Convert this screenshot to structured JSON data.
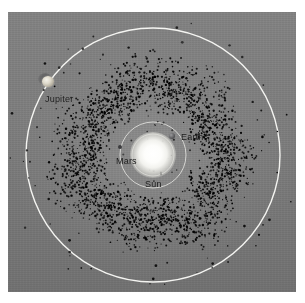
{
  "figure": {
    "background_color": "#7b7b7b",
    "panel": {
      "x": 8,
      "y": 12,
      "width": 288,
      "height": 280
    }
  },
  "chart_data": {
    "type": "scatter",
    "xlabel": "",
    "ylabel": "",
    "grid": false,
    "legend_position": "none",
    "coordinate_system": "polar (ecliptic plane, heliocentric)",
    "center_px": {
      "x": 145,
      "y": 143
    },
    "background_color": "#7b7b7b",
    "asteroid_color": "#ffffff",
    "orbit_color": "#f0f0ec",
    "asteroid_belt": {
      "name": "Main asteroid belt",
      "point_count": 2600,
      "inner_radius_px": 42,
      "outer_radius_px": 108,
      "peak_density_radius_px": 72,
      "dot_size_px_range": [
        1,
        2.4
      ],
      "scatter_outliers": 70,
      "outlier_radius_px_range": [
        110,
        150
      ]
    },
    "orbits": [
      {
        "name": "Earth orbit",
        "radius_px": 21,
        "stroke": "#f2f2ee",
        "width_px": 1
      },
      {
        "name": "Mars orbit",
        "radius_px": 33,
        "stroke": "#f2f2ee",
        "width_px": 1
      },
      {
        "name": "Jupiter orbit",
        "radius_px": 127,
        "stroke": "#fbfbf8",
        "width_px": 1.4
      }
    ],
    "bodies": [
      {
        "name": "Sun",
        "label": "Sun",
        "x_px": 145,
        "y_px": 143,
        "radius_px": 11,
        "color": "#ffffff",
        "label_dx": 0,
        "label_dy": 24
      },
      {
        "name": "Earth",
        "label": "Earth",
        "x_px": 164,
        "y_px": 124,
        "radius_px": 3,
        "color": "#5a5a5c",
        "label_dx": 9,
        "label_dy": -4
      },
      {
        "name": "Mars",
        "label": "Mars",
        "x_px": 112,
        "y_px": 135,
        "radius_px": 2,
        "color": "#3c3c3e",
        "label_dx": -4,
        "label_dy": 9
      },
      {
        "name": "Jupiter",
        "label": "Jupiter",
        "x_px": 40,
        "y_px": 70,
        "radius_px": 6,
        "color": "#ded9cb",
        "label_dx": -3,
        "label_dy": 12
      }
    ]
  },
  "labels": {
    "sun": "Sun",
    "earth": "Earth",
    "mars": "Mars",
    "jupiter": "Jupiter"
  }
}
